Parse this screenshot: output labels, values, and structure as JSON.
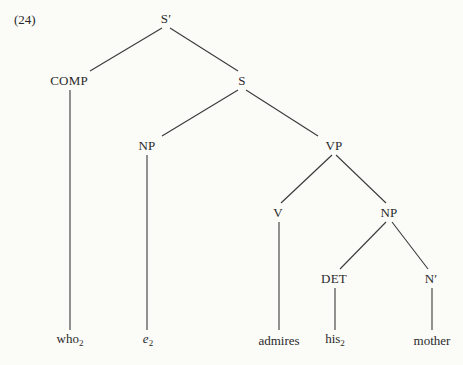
{
  "example_number": "(24)",
  "nodes": [
    {
      "id": "Sbar",
      "text": "S",
      "prime": "′",
      "x": 166,
      "y": 18
    },
    {
      "id": "COMP",
      "text": "COMP",
      "x": 69,
      "y": 80
    },
    {
      "id": "S",
      "text": "S",
      "x": 242,
      "y": 80
    },
    {
      "id": "NP1",
      "text": "NP",
      "x": 147,
      "y": 145
    },
    {
      "id": "VP",
      "text": "VP",
      "x": 334,
      "y": 145
    },
    {
      "id": "V",
      "text": "V",
      "x": 278,
      "y": 212
    },
    {
      "id": "NP2",
      "text": "NP",
      "x": 389,
      "y": 212
    },
    {
      "id": "DET",
      "text": "DET",
      "x": 334,
      "y": 278
    },
    {
      "id": "Nbar",
      "text": "N",
      "prime": "′",
      "x": 431,
      "y": 278
    }
  ],
  "leaves": [
    {
      "id": "who",
      "text": "who",
      "sub": "2",
      "x": 70,
      "y": 340,
      "italic": false
    },
    {
      "id": "e",
      "text": "e",
      "sub": "2",
      "x": 148,
      "y": 340,
      "italic": true
    },
    {
      "id": "admires",
      "text": "admires",
      "x": 279,
      "y": 340,
      "italic": false
    },
    {
      "id": "his",
      "text": "his",
      "sub": "2",
      "x": 335,
      "y": 340,
      "italic": false
    },
    {
      "id": "mother",
      "text": "mother",
      "x": 432,
      "y": 340,
      "italic": false
    }
  ],
  "edges": [
    {
      "from": [
        162,
        28
      ],
      "to": [
        90,
        71
      ]
    },
    {
      "from": [
        170,
        28
      ],
      "to": [
        238,
        71
      ]
    },
    {
      "from": [
        70,
        90
      ],
      "to": [
        70,
        330
      ]
    },
    {
      "from": [
        238,
        90
      ],
      "to": [
        162,
        136
      ]
    },
    {
      "from": [
        246,
        90
      ],
      "to": [
        318,
        136
      ]
    },
    {
      "from": [
        147,
        155
      ],
      "to": [
        147,
        330
      ]
    },
    {
      "from": [
        332,
        155
      ],
      "to": [
        281,
        203
      ]
    },
    {
      "from": [
        336,
        155
      ],
      "to": [
        386,
        203
      ]
    },
    {
      "from": [
        279,
        222
      ],
      "to": [
        279,
        330
      ]
    },
    {
      "from": [
        386,
        222
      ],
      "to": [
        340,
        269
      ]
    },
    {
      "from": [
        392,
        222
      ],
      "to": [
        428,
        269
      ]
    },
    {
      "from": [
        335,
        288
      ],
      "to": [
        335,
        330
      ]
    },
    {
      "from": [
        432,
        288
      ],
      "to": [
        432,
        330
      ]
    }
  ]
}
